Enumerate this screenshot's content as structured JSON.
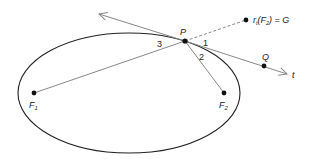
{
  "diagram": {
    "colors": {
      "ellipse": "#222222",
      "lines": "#888888",
      "points": "#111111",
      "text": "#222222"
    },
    "points": {
      "P": {
        "label": "P",
        "x": 185,
        "y": 41
      },
      "F1": {
        "label": "F",
        "sub": "1",
        "x": 34,
        "y": 93
      },
      "F2": {
        "label": "F",
        "sub": "2",
        "x": 224,
        "y": 93
      },
      "Q": {
        "label": "Q",
        "x": 264,
        "y": 66
      },
      "G": {
        "label": "r",
        "sub_t": "t",
        "paren_open": "(F",
        "sub_2": "2",
        "rest": ") = G",
        "x": 246,
        "y": 20
      }
    },
    "tangent_line": {
      "label": "t"
    },
    "angles": {
      "a1": "1",
      "a2": "2",
      "a3": "3"
    },
    "ellipse": {
      "cx": 129,
      "cy": 93,
      "rx": 111,
      "ry": 60
    }
  }
}
